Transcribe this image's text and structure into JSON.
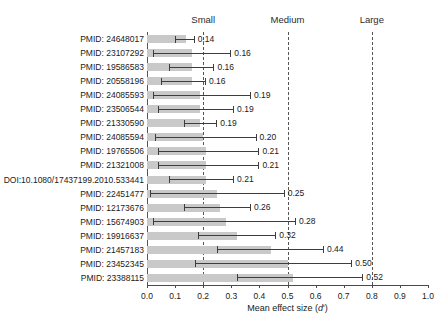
{
  "chart_data": {
    "type": "bar",
    "title": "",
    "xlabel": "Mean effect size (d')",
    "ylabel": "",
    "xlim": [
      0.0,
      1.0
    ],
    "grid": false,
    "legend": "none",
    "orientation": "horizontal",
    "xticks": [
      "0.0",
      "0.1",
      "0.2",
      "0.3",
      "0.4",
      "0.5",
      "0.6",
      "0.7",
      "0.8",
      "0.9",
      "1.0"
    ],
    "xtick_values": [
      0.0,
      0.1,
      0.2,
      0.3,
      0.4,
      0.5,
      0.6,
      0.7,
      0.8,
      0.9,
      1.0
    ],
    "reference_lines": [
      {
        "label": "Small",
        "value": 0.2
      },
      {
        "label": "Medium",
        "value": 0.5
      },
      {
        "label": "Large",
        "value": 0.8
      }
    ],
    "categories": [
      "PMID: 24648017",
      "PMID: 23107292",
      "PMID: 19586583",
      "PMID: 20558196",
      "PMID: 24085593",
      "PMID: 23506544",
      "PMID: 21330590",
      "PMID: 24085594",
      "PMID: 19765506",
      "PMID: 21321008",
      "DOI:10.1080/17437199.2010.533441",
      "PMID: 22451477",
      "PMID: 12173676",
      "PMID: 15674903",
      "PMID: 19916637",
      "PMID: 21457183",
      "PMID: 23452345",
      "PMID: 23388115"
    ],
    "values": [
      0.14,
      0.16,
      0.16,
      0.16,
      0.19,
      0.19,
      0.19,
      0.2,
      0.21,
      0.21,
      0.21,
      0.25,
      0.26,
      0.28,
      0.32,
      0.44,
      0.5,
      0.52
    ],
    "value_labels": [
      "0.14",
      "0.16",
      "0.16",
      "0.16",
      "0.19",
      "0.19",
      "0.19",
      "0.20",
      "0.21",
      "0.21",
      "0.21",
      "0.25",
      "0.26",
      "0.28",
      "0.32",
      "0.44",
      "0.50",
      "0.52"
    ],
    "ci_low": [
      0.1,
      0.02,
      0.08,
      0.05,
      0.02,
      0.04,
      0.13,
      0.03,
      0.04,
      0.04,
      0.08,
      0.01,
      0.13,
      0.02,
      0.18,
      0.25,
      0.17,
      0.32
    ],
    "ci_high": [
      0.17,
      0.3,
      0.24,
      0.21,
      0.37,
      0.31,
      0.25,
      0.39,
      0.4,
      0.4,
      0.31,
      0.49,
      0.37,
      0.53,
      0.46,
      0.63,
      0.73,
      0.77
    ]
  },
  "colors": {
    "bar_fill": "#c9c9c9",
    "error_bar": "#3d3d3d",
    "reference_line": "#555555",
    "axis": "#4a4a4a",
    "text": "#1a1a1a"
  }
}
